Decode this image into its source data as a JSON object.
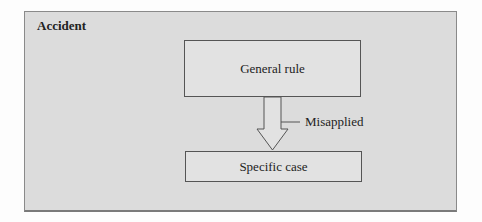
{
  "diagram": {
    "title": "Accident",
    "nodes": [
      {
        "id": "general",
        "label": "General rule"
      },
      {
        "id": "specific",
        "label": "Specific case"
      }
    ],
    "edges": [
      {
        "from": "general",
        "to": "specific",
        "label": "Misapplied"
      }
    ],
    "colors": {
      "panel": "#dcdcdc",
      "border": "#555555"
    }
  }
}
